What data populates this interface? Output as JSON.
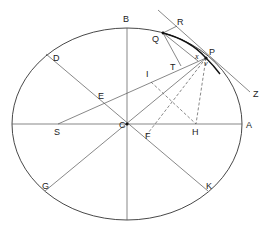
{
  "figure": {
    "type": "geometric-ellipse-construction",
    "ellipse": {
      "cx": 127,
      "cy": 124,
      "rx": 115,
      "ry": 96
    },
    "labels": {
      "A": "A",
      "B": "B",
      "C": "C",
      "D": "D",
      "E": "E",
      "F": "F",
      "G": "G",
      "H": "H",
      "I": "I",
      "K": "K",
      "P": "P",
      "Q": "Q",
      "R": "R",
      "S": "S",
      "T": "T",
      "Z": "Z",
      "x": "x",
      "v": "v"
    },
    "points": {
      "C": [
        127,
        124
      ],
      "P": [
        206,
        58
      ],
      "Q": [
        163,
        33
      ],
      "S": [
        58,
        124
      ],
      "H": [
        196,
        124
      ],
      "I": [
        151,
        82
      ],
      "F": [
        145,
        137
      ],
      "T": [
        181,
        66
      ],
      "D": [
        46,
        54
      ],
      "K": [
        208,
        190
      ],
      "G": [
        45,
        191
      ],
      "E": [
        102,
        102
      ]
    },
    "lines": [
      {
        "from": "S",
        "to": "P",
        "style": "solid"
      },
      {
        "from": "C",
        "to": "P",
        "style": "solid"
      },
      {
        "from": "D",
        "to": "K",
        "style": "solid"
      },
      {
        "from": "G",
        "to": "C",
        "style": "solid"
      },
      {
        "from": "Q",
        "to": "T",
        "style": "solid"
      },
      {
        "from": "Q",
        "to": "P",
        "style": "solid"
      },
      {
        "from": "Q",
        "to": "R",
        "style": "solid"
      },
      {
        "from": "R",
        "to": "Z",
        "style": "solid",
        "note": "tangent at P"
      },
      {
        "from": "I",
        "to": "H",
        "style": "dashed"
      },
      {
        "from": "P",
        "to": "H",
        "style": "dashed"
      },
      {
        "from": "P",
        "to": "F",
        "style": "dashed"
      }
    ],
    "axes": [
      "major axis (horizontal through C)",
      "minor axis (vertical through C, B at top)"
    ]
  }
}
